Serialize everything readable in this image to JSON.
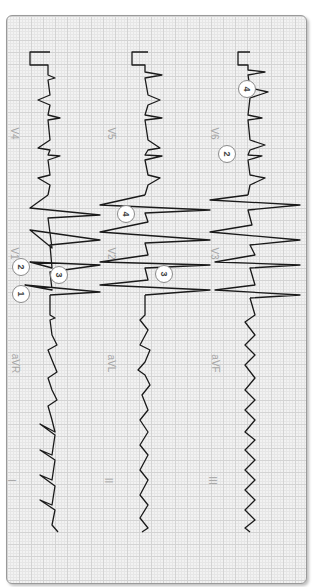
{
  "figure": {
    "leads": [
      {
        "id": "I",
        "label": "I"
      },
      {
        "id": "II",
        "label": "II"
      },
      {
        "id": "III",
        "label": "III"
      },
      {
        "id": "aVR",
        "label": "aVR"
      },
      {
        "id": "aVL",
        "label": "aVL"
      },
      {
        "id": "aVF",
        "label": "aVF"
      },
      {
        "id": "V1",
        "label": "V1"
      },
      {
        "id": "V2",
        "label": "V2"
      },
      {
        "id": "V3",
        "label": "V3"
      },
      {
        "id": "V4",
        "label": "V4"
      },
      {
        "id": "V5",
        "label": "V5"
      },
      {
        "id": "V6",
        "label": "V6"
      }
    ],
    "callouts": [
      {
        "number": "1",
        "lead": "V1"
      },
      {
        "number": "2",
        "lead": "V1"
      },
      {
        "number": "3",
        "lead": "V1"
      },
      {
        "number": "4",
        "lead": "V2"
      },
      {
        "number": "3",
        "lead": "V2"
      },
      {
        "number": "2",
        "lead": "V6"
      },
      {
        "number": "4",
        "lead": "V6"
      }
    ],
    "colors": {
      "grid_major": "#d3d3d3",
      "grid_minor": "#e6e6e6",
      "trace": "#1a1a1a",
      "frame": "#9a9a9a",
      "label": "#a6a6a6"
    }
  }
}
